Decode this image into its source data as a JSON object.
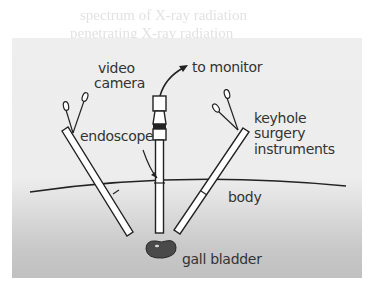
{
  "bleed_through": {
    "line1": "spectrum of X-ray radiation",
    "line2": "penetrating X-ray radiation"
  },
  "labels": {
    "video_camera_1": "video",
    "video_camera_2": "camera",
    "to_monitor": "to monitor",
    "endoscope": "endoscope",
    "keyhole_1": "keyhole",
    "keyhole_2": "surgery",
    "keyhole_3": "instruments",
    "body": "body",
    "gall_bladder": "gall bladder"
  },
  "colors": {
    "outline": "#222222",
    "gall_bladder": "#4a4a4a",
    "panel_top": "#eeeeee",
    "panel_bottom": "#c0c0c0"
  }
}
